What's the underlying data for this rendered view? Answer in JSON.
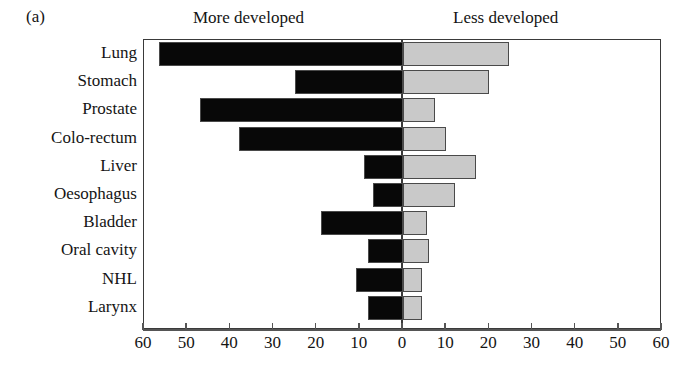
{
  "panel": {
    "letter": "(a)"
  },
  "headings": {
    "left": "More developed",
    "right": "Less developed"
  },
  "chart_data": {
    "type": "bar",
    "orientation": "horizontal",
    "layout": "diverging-bidirectional",
    "title": "(a)",
    "xlabel": "",
    "ylabel": "",
    "xlim": [
      -60,
      60
    ],
    "axis_display_absolute": true,
    "grid": false,
    "legend_position": "top",
    "tick_values": [
      -60,
      -50,
      -40,
      -30,
      -20,
      -10,
      0,
      10,
      20,
      30,
      40,
      50,
      60
    ],
    "tick_labels": [
      "60",
      "50",
      "40",
      "30",
      "20",
      "10",
      "0",
      "10",
      "20",
      "30",
      "40",
      "50",
      "60"
    ],
    "categories": [
      "Lung",
      "Stomach",
      "Prostate",
      "Colo-rectum",
      "Liver",
      "Oesophagus",
      "Bladder",
      "Oral cavity",
      "NHL",
      "Larynx"
    ],
    "series": [
      {
        "name": "More developed",
        "direction": "left",
        "color": "#080808",
        "values": [
          56.5,
          25.0,
          47.0,
          38.0,
          9.0,
          7.0,
          19.0,
          8.0,
          11.0,
          8.0
        ]
      },
      {
        "name": "Less developed",
        "direction": "right",
        "color": "#c9c9c9",
        "values": [
          24.5,
          20.0,
          7.5,
          10.0,
          17.0,
          12.0,
          5.5,
          6.0,
          4.5,
          4.5
        ]
      }
    ]
  }
}
